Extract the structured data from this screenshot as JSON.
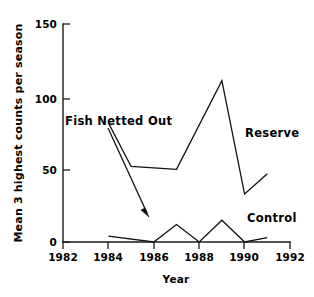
{
  "chart_data": {
    "type": "line",
    "title": "",
    "xlabel": "Year",
    "ylabel": "Mean 3 highest counts per season",
    "xlim": [
      1982,
      1992
    ],
    "ylim": [
      0,
      150
    ],
    "grid": false,
    "legend_position": "inline-labels",
    "xticks": [
      "1982",
      "1984",
      "1986",
      "1988",
      "1990",
      "1992"
    ],
    "xtick_values": [
      1982,
      1984,
      1986,
      1988,
      1990,
      1992
    ],
    "yticks": [
      "0",
      "50",
      "100",
      "150"
    ],
    "ytick_values": [
      0,
      50,
      100,
      150
    ],
    "series": [
      {
        "name": "Reserve",
        "x": [
          1984,
          1985,
          1987,
          1989,
          1990,
          1991
        ],
        "values": [
          82,
          52,
          50,
          111,
          33,
          47
        ]
      },
      {
        "name": "Control",
        "x": [
          1984,
          1986,
          1987,
          1988,
          1989,
          1990,
          1991
        ],
        "values": [
          4,
          0,
          12,
          0,
          15,
          0,
          3
        ]
      }
    ],
    "annotations": [
      {
        "text": "Fish Netted Out",
        "type": "arrow",
        "label_x": 1984.0,
        "label_y": 92,
        "arrow_from_x": 1984.0,
        "arrow_from_y": 80,
        "arrow_to_x": 1986.0,
        "arrow_to_y": 22
      },
      {
        "text": "Reserve",
        "type": "series-label",
        "label_x": 1990.0,
        "label_y": 78
      },
      {
        "text": "Control",
        "type": "series-label",
        "label_x": 1990.1,
        "label_y": 24
      }
    ],
    "colors": {
      "line": "#111111",
      "axis": "#1a1a1a",
      "background": "#ffffff"
    }
  },
  "axes": {
    "y_title": "Mean 3 highest counts per season",
    "x_title": "Year",
    "ytick_labels": [
      "150",
      "100",
      "50",
      "0"
    ],
    "xtick_labels": [
      "1982",
      "1984",
      "1986",
      "1988",
      "1990",
      "1992"
    ]
  },
  "labels": {
    "fish_netted_out": "Fish Netted Out",
    "reserve": "Reserve",
    "control": "Control"
  }
}
